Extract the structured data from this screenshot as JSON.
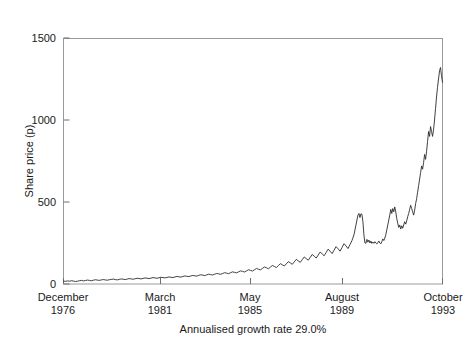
{
  "chart_data": {
    "type": "line",
    "title": "",
    "subtitle": "",
    "caption": "Annualised growth rate 29.0%",
    "xlabel": "",
    "ylabel": "Share price (p)",
    "ylim": [
      0,
      1500
    ],
    "yticks": [
      0,
      500,
      1000,
      1500
    ],
    "ytick_labels": [
      "0",
      "500",
      "1000",
      "1500"
    ],
    "grid": false,
    "legend": null,
    "line_color": "#2b2b2b",
    "frame_color": "#9a9a9a",
    "background": "#ffffff",
    "xticks": [
      {
        "month": "December",
        "year": "1976"
      },
      {
        "month": "March",
        "year": "1981"
      },
      {
        "month": "May",
        "year": "1985"
      },
      {
        "month": "August",
        "year": "1989"
      },
      {
        "month": "October",
        "year": "1993"
      }
    ],
    "x_range_start": "December 1976",
    "x_range_end": "October 1993",
    "series": [
      {
        "name": "Share price",
        "units": "p",
        "points": [
          [
            0.0,
            18
          ],
          [
            0.006,
            16
          ],
          [
            0.012,
            19
          ],
          [
            0.018,
            17
          ],
          [
            0.024,
            20
          ],
          [
            0.03,
            18
          ],
          [
            0.036,
            15
          ],
          [
            0.042,
            17
          ],
          [
            0.048,
            20
          ],
          [
            0.054,
            22
          ],
          [
            0.06,
            19
          ],
          [
            0.066,
            21
          ],
          [
            0.072,
            24
          ],
          [
            0.078,
            22
          ],
          [
            0.084,
            20
          ],
          [
            0.09,
            23
          ],
          [
            0.096,
            26
          ],
          [
            0.102,
            24
          ],
          [
            0.108,
            22
          ],
          [
            0.114,
            25
          ],
          [
            0.12,
            27
          ],
          [
            0.126,
            25
          ],
          [
            0.132,
            23
          ],
          [
            0.138,
            26
          ],
          [
            0.144,
            28
          ],
          [
            0.15,
            30
          ],
          [
            0.156,
            27
          ],
          [
            0.162,
            25
          ],
          [
            0.168,
            28
          ],
          [
            0.174,
            31
          ],
          [
            0.18,
            29
          ],
          [
            0.186,
            27
          ],
          [
            0.192,
            30
          ],
          [
            0.198,
            33
          ],
          [
            0.204,
            31
          ],
          [
            0.21,
            29
          ],
          [
            0.216,
            32
          ],
          [
            0.222,
            35
          ],
          [
            0.228,
            33
          ],
          [
            0.234,
            31
          ],
          [
            0.24,
            34
          ],
          [
            0.246,
            37
          ],
          [
            0.252,
            35
          ],
          [
            0.258,
            33
          ],
          [
            0.264,
            36
          ],
          [
            0.27,
            39
          ],
          [
            0.276,
            37
          ],
          [
            0.282,
            35
          ],
          [
            0.288,
            38
          ],
          [
            0.294,
            41
          ],
          [
            0.3,
            39
          ],
          [
            0.306,
            37
          ],
          [
            0.312,
            40
          ],
          [
            0.318,
            43
          ],
          [
            0.324,
            41
          ],
          [
            0.33,
            39
          ],
          [
            0.336,
            43
          ],
          [
            0.342,
            46
          ],
          [
            0.348,
            44
          ],
          [
            0.354,
            42
          ],
          [
            0.36,
            46
          ],
          [
            0.366,
            49
          ],
          [
            0.372,
            47
          ],
          [
            0.378,
            45
          ],
          [
            0.384,
            49
          ],
          [
            0.39,
            52
          ],
          [
            0.396,
            50
          ],
          [
            0.402,
            48
          ],
          [
            0.408,
            53
          ],
          [
            0.414,
            56
          ],
          [
            0.42,
            54
          ],
          [
            0.426,
            51
          ],
          [
            0.432,
            56
          ],
          [
            0.438,
            60
          ],
          [
            0.444,
            57
          ],
          [
            0.45,
            55
          ],
          [
            0.456,
            60
          ],
          [
            0.462,
            64
          ],
          [
            0.468,
            62
          ],
          [
            0.474,
            59
          ],
          [
            0.48,
            64
          ],
          [
            0.486,
            69
          ],
          [
            0.492,
            66
          ],
          [
            0.498,
            63
          ],
          [
            0.504,
            69
          ],
          [
            0.51,
            74
          ],
          [
            0.516,
            71
          ],
          [
            0.522,
            68
          ],
          [
            0.528,
            74
          ],
          [
            0.534,
            80
          ],
          [
            0.54,
            77
          ],
          [
            0.546,
            73
          ],
          [
            0.552,
            80
          ],
          [
            0.558,
            87
          ],
          [
            0.564,
            83
          ],
          [
            0.57,
            79
          ],
          [
            0.576,
            87
          ],
          [
            0.582,
            95
          ],
          [
            0.588,
            90
          ],
          [
            0.594,
            86
          ],
          [
            0.6,
            95
          ],
          [
            0.606,
            104
          ],
          [
            0.612,
            99
          ],
          [
            0.618,
            93
          ],
          [
            0.624,
            103
          ],
          [
            0.63,
            113
          ],
          [
            0.636,
            107
          ],
          [
            0.642,
            100
          ],
          [
            0.648,
            112
          ],
          [
            0.654,
            124
          ],
          [
            0.66,
            117
          ],
          [
            0.666,
            110
          ],
          [
            0.672,
            123
          ],
          [
            0.678,
            136
          ],
          [
            0.684,
            129
          ],
          [
            0.69,
            120
          ],
          [
            0.696,
            135
          ],
          [
            0.702,
            150
          ],
          [
            0.708,
            141
          ],
          [
            0.714,
            132
          ],
          [
            0.72,
            148
          ],
          [
            0.726,
            165
          ],
          [
            0.732,
            155
          ],
          [
            0.738,
            145
          ],
          [
            0.744,
            162
          ],
          [
            0.75,
            180
          ],
          [
            0.756,
            170
          ],
          [
            0.762,
            158
          ],
          [
            0.768,
            176
          ],
          [
            0.774,
            195
          ],
          [
            0.78,
            184
          ],
          [
            0.786,
            172
          ],
          [
            0.792,
            192
          ],
          [
            0.798,
            212
          ],
          [
            0.804,
            200
          ],
          [
            0.81,
            186
          ],
          [
            0.816,
            206
          ],
          [
            0.822,
            228
          ],
          [
            0.828,
            215
          ],
          [
            0.834,
            200
          ],
          [
            0.84,
            222
          ],
          [
            0.846,
            246
          ],
          [
            0.852,
            232
          ],
          [
            0.858,
            216
          ],
          [
            0.864,
            240
          ],
          [
            0.87,
            265
          ],
          [
            0.876,
            300
          ],
          [
            0.882,
            360
          ],
          [
            0.888,
            420
          ],
          [
            0.891,
            430
          ],
          [
            0.894,
            405
          ],
          [
            0.897,
            428
          ],
          [
            0.9,
            425
          ],
          [
            0.903,
            380
          ],
          [
            0.906,
            300
          ],
          [
            0.909,
            250
          ],
          [
            0.912,
            248
          ],
          [
            0.915,
            272
          ],
          [
            0.918,
            255
          ],
          [
            0.921,
            268
          ],
          [
            0.924,
            250
          ],
          [
            0.927,
            262
          ],
          [
            0.93,
            248
          ],
          [
            0.933,
            256
          ],
          [
            0.936,
            248
          ],
          [
            0.939,
            258
          ],
          [
            0.942,
            250
          ],
          [
            0.945,
            244
          ],
          [
            0.948,
            252
          ],
          [
            0.951,
            262
          ],
          [
            0.954,
            250
          ],
          [
            0.957,
            245
          ],
          [
            0.96,
            258
          ],
          [
            0.963,
            275
          ],
          [
            0.966,
            265
          ],
          [
            0.969,
            280
          ],
          [
            0.972,
            300
          ],
          [
            0.975,
            330
          ],
          [
            0.978,
            360
          ],
          [
            0.981,
            390
          ],
          [
            0.984,
            420
          ],
          [
            0.987,
            455
          ],
          [
            0.99,
            430
          ],
          [
            0.993,
            460
          ],
          [
            0.996,
            440
          ],
          [
            0.999,
            470
          ],
          [
            1.002,
            440
          ],
          [
            1.005,
            400
          ],
          [
            1.008,
            370
          ],
          [
            1.011,
            345
          ],
          [
            1.014,
            360
          ],
          [
            1.017,
            335
          ],
          [
            1.02,
            355
          ],
          [
            1.023,
            340
          ],
          [
            1.026,
            360
          ],
          [
            1.029,
            380
          ],
          [
            1.032,
            365
          ],
          [
            1.035,
            385
          ],
          [
            1.038,
            410
          ],
          [
            1.041,
            430
          ],
          [
            1.044,
            455
          ],
          [
            1.047,
            480
          ],
          [
            1.05,
            460
          ],
          [
            1.053,
            440
          ],
          [
            1.056,
            420
          ],
          [
            1.059,
            450
          ],
          [
            1.062,
            490
          ],
          [
            1.065,
            520
          ],
          [
            1.068,
            560
          ],
          [
            1.071,
            600
          ],
          [
            1.074,
            640
          ],
          [
            1.077,
            680
          ],
          [
            1.08,
            720
          ],
          [
            1.083,
            700
          ],
          [
            1.086,
            740
          ],
          [
            1.089,
            790
          ],
          [
            1.092,
            760
          ],
          [
            1.095,
            810
          ],
          [
            1.098,
            870
          ],
          [
            1.101,
            930
          ],
          [
            1.104,
            900
          ],
          [
            1.107,
            960
          ],
          [
            1.11,
            930
          ],
          [
            1.113,
            900
          ],
          [
            1.116,
            940
          ],
          [
            1.119,
            1000
          ],
          [
            1.122,
            1070
          ],
          [
            1.125,
            1140
          ],
          [
            1.128,
            1200
          ],
          [
            1.131,
            1250
          ],
          [
            1.134,
            1300
          ],
          [
            1.137,
            1320
          ],
          [
            1.14,
            1270
          ],
          [
            1.143,
            1230
          ]
        ]
      }
    ]
  },
  "axis": {
    "ylabel": "Share price (p)",
    "ytick_labels": [
      "0",
      "500",
      "1000",
      "1500"
    ],
    "caption": "Annualised growth rate 29.0%",
    "xticks": [
      {
        "month": "December",
        "year": "1976"
      },
      {
        "month": "March",
        "year": "1981"
      },
      {
        "month": "May",
        "year": "1985"
      },
      {
        "month": "August",
        "year": "1989"
      },
      {
        "month": "October",
        "year": "1993"
      }
    ]
  }
}
